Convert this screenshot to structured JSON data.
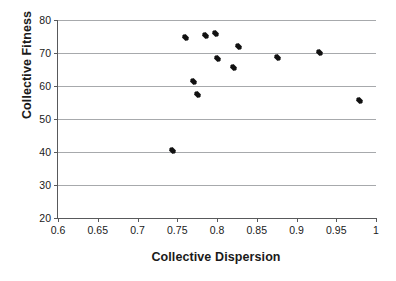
{
  "chart_data": {
    "type": "scatter",
    "title": "",
    "xlabel": "Collective Dispersion",
    "ylabel": "Collective Fitness",
    "xlim": [
      0.6,
      1.0
    ],
    "ylim": [
      20,
      80
    ],
    "xticks": [
      "0.6",
      "0.65",
      "0.7",
      "0.75",
      "0.8",
      "0.85",
      "0.9",
      "0.95",
      "1"
    ],
    "xtick_values": [
      0.6,
      0.65,
      0.7,
      0.75,
      0.8,
      0.85,
      0.9,
      0.95,
      1.0
    ],
    "yticks": [
      "20",
      "30",
      "40",
      "50",
      "60",
      "70",
      "80"
    ],
    "ytick_values": [
      20,
      30,
      40,
      50,
      60,
      70,
      80
    ],
    "grid": "horizontal",
    "legend": "none",
    "marker": "diamond",
    "marker_color": "#111111",
    "series": [
      {
        "name": "Collective Fitness vs Collective Dispersion",
        "points": [
          {
            "x": 0.744,
            "y": 40.6
          },
          {
            "x": 0.76,
            "y": 74.7
          },
          {
            "x": 0.77,
            "y": 61.5
          },
          {
            "x": 0.775,
            "y": 57.5
          },
          {
            "x": 0.786,
            "y": 75.4
          },
          {
            "x": 0.798,
            "y": 75.8
          },
          {
            "x": 0.801,
            "y": 68.2
          },
          {
            "x": 0.821,
            "y": 65.6
          },
          {
            "x": 0.827,
            "y": 71.9
          },
          {
            "x": 0.876,
            "y": 68.7
          },
          {
            "x": 0.929,
            "y": 70.1
          },
          {
            "x": 0.979,
            "y": 55.6
          }
        ]
      }
    ]
  },
  "axis_titles": {
    "x": "Collective Dispersion",
    "y": "Collective Fitness"
  }
}
